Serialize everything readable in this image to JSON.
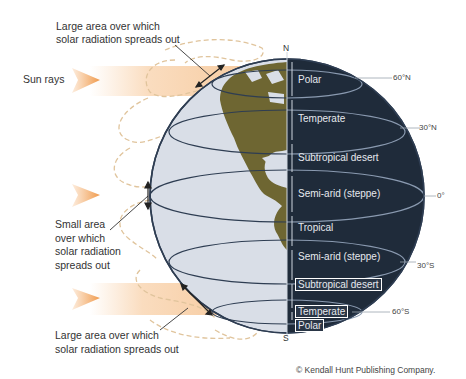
{
  "diagram": {
    "type": "labeled illustration",
    "labels": {
      "sun_rays": "Sun rays",
      "large_area_top": [
        "Large area over which",
        "solar radiation spreads out"
      ],
      "small_area": [
        "Small area",
        "over which",
        "solar radiation",
        "spreads out"
      ],
      "large_area_bottom": [
        "Large area over which",
        "solar radiation spreads out"
      ],
      "north": "N",
      "south": "S"
    },
    "climate_zones": [
      {
        "name": "Polar",
        "hemisphere": "north"
      },
      {
        "name": "Temperate",
        "hemisphere": "north"
      },
      {
        "name": "Subtropical desert",
        "hemisphere": "north"
      },
      {
        "name": "Semi-arid (steppe)",
        "hemisphere": "north"
      },
      {
        "name": "Tropical",
        "hemisphere": "equator"
      },
      {
        "name": "Semi-arid (steppe)",
        "hemisphere": "south"
      },
      {
        "name": "Subtropical desert",
        "hemisphere": "south"
      },
      {
        "name": "Temperate",
        "hemisphere": "south"
      },
      {
        "name": "Polar",
        "hemisphere": "south"
      }
    ],
    "latitudes": [
      "60°N",
      "30°N",
      "0°",
      "30°S",
      "60°S"
    ],
    "colors": {
      "night_side": "#1f2b3a",
      "ocean": "#d9dee7",
      "land": "#6e6632",
      "sunbeam": "#f6c08a",
      "airflow": "#e3c9a2"
    },
    "credit": "© Kendall Hunt Publishing Company."
  }
}
